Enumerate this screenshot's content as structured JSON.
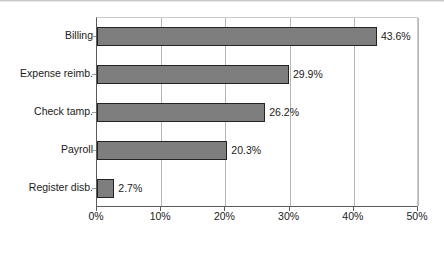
{
  "chart_data": {
    "type": "bar",
    "orientation": "horizontal",
    "title": "",
    "subtitle": "",
    "xlabel": "",
    "ylabel": "",
    "categories": [
      "Billing",
      "Expense reimb.",
      "Check tamp.",
      "Payroll",
      "Register disb."
    ],
    "values": [
      43.6,
      29.9,
      26.2,
      20.3,
      2.7
    ],
    "data_labels": [
      "43.6%",
      "29.9%",
      "26.2%",
      "20.3%",
      "2.7%"
    ],
    "xlim": [
      0,
      50
    ],
    "x_tick_values": [
      0,
      10,
      20,
      30,
      40,
      50
    ],
    "x_tick_labels": [
      "0%",
      "10%",
      "20%",
      "30%",
      "40%",
      "50%"
    ],
    "grid": true,
    "grid_axis": "x",
    "legend": false,
    "legend_position": "none",
    "series": [
      {
        "name": "",
        "values": [
          43.6,
          29.9,
          26.2,
          20.3,
          2.7
        ]
      }
    ],
    "colors": {
      "bar_fill": "#7e7e7e",
      "bar_border": "#232323",
      "gridline": "#b6b6b6",
      "axis": "#5a5a5a",
      "text": "#1a1a1a",
      "background": "#ffffff"
    }
  }
}
